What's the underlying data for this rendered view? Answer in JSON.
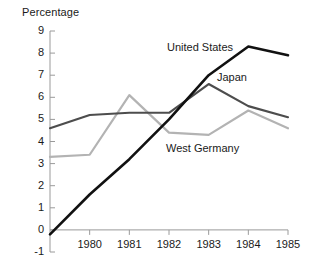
{
  "chart_data": {
    "type": "line",
    "title": "",
    "ylabel": "Percentage",
    "xlabel": "",
    "grid": false,
    "legend_position": "inline-annotations",
    "x": [
      1979,
      1980,
      1981,
      1982,
      1983,
      1984,
      1985
    ],
    "xtick_labels": [
      "1980",
      "1981",
      "1982",
      "1983",
      "1984",
      "1985"
    ],
    "xtick_values": [
      1980,
      1981,
      1982,
      1983,
      1984,
      1985
    ],
    "xlim": [
      1979,
      1985
    ],
    "ylim": [
      -1,
      9
    ],
    "ytick_labels": [
      "9",
      "8",
      "7",
      "6",
      "5",
      "4",
      "3",
      "2",
      "1",
      "0",
      "-1"
    ],
    "ytick_values": [
      9,
      8,
      7,
      6,
      5,
      4,
      3,
      2,
      1,
      0,
      -1
    ],
    "series": [
      {
        "name": "United States",
        "color": "#111111",
        "values": [
          -0.2,
          1.6,
          3.2,
          5.0,
          7.0,
          8.3,
          7.9
        ]
      },
      {
        "name": "Japan",
        "color": "#4d4d4d",
        "values": [
          4.6,
          5.2,
          5.3,
          5.3,
          6.6,
          5.6,
          5.1
        ]
      },
      {
        "name": "West Germany",
        "color": "#b3b3b3",
        "values": [
          3.3,
          3.4,
          6.1,
          4.4,
          4.3,
          5.4,
          4.6
        ]
      }
    ]
  },
  "annotations": [
    {
      "name": "united-states",
      "text": "United States"
    },
    {
      "name": "japan",
      "text": "Japan"
    },
    {
      "name": "west-germany",
      "text": "West Germany"
    }
  ]
}
